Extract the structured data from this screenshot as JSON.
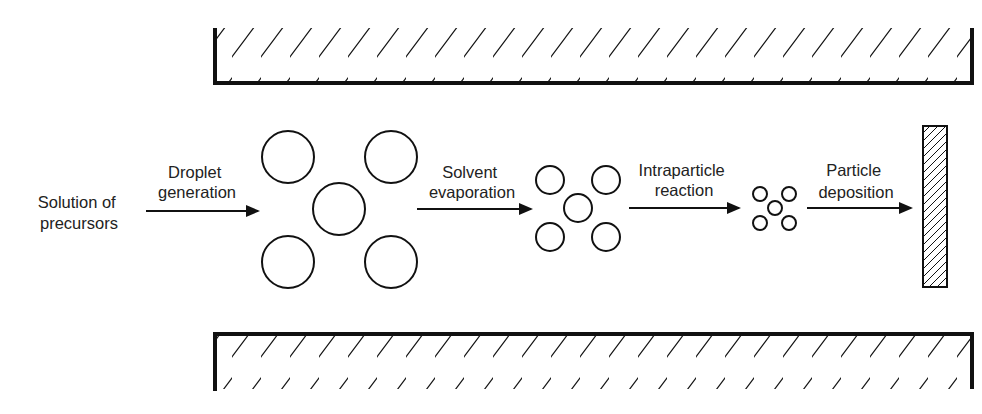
{
  "diagram": {
    "type": "process-flow",
    "colors": {
      "stroke": "#111111",
      "text": "#222222",
      "background": "#ffffff"
    },
    "source": {
      "line1": "Solution of",
      "line2": "precursors"
    },
    "steps": [
      {
        "line1": "Droplet",
        "line2": "generation"
      },
      {
        "line1": "Solvent",
        "line2": "evaporation"
      },
      {
        "line1": "Intraparticle",
        "line2": "reaction"
      },
      {
        "line1": "Particle",
        "line2": "deposition"
      }
    ],
    "stages": [
      {
        "name": "droplets",
        "count": 5,
        "relative_size": "large"
      },
      {
        "name": "dried-particles",
        "count": 5,
        "relative_size": "medium"
      },
      {
        "name": "reacted-particles",
        "count": 5,
        "relative_size": "small"
      }
    ],
    "walls": [
      "top-wall",
      "bottom-wall"
    ],
    "target": "deposition-substrate"
  }
}
